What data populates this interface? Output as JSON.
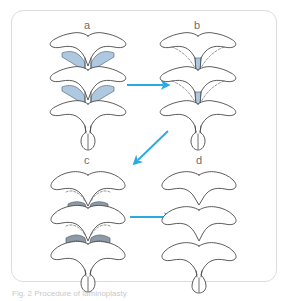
{
  "figure": {
    "background_color": "#ffffff",
    "frame_border_color": "#dcdcdc",
    "caption": "Fig. 2   Procedure of laminoplasty",
    "panels": [
      {
        "id": "a",
        "label": "a",
        "description": "Three stacked cervical vertebrae, posterior view, with bilateral laminae shaded light blue"
      },
      {
        "id": "b",
        "label": "b",
        "description": "Vertebrae after midline splitting, narrow central blue trough with dashed gutter lines"
      },
      {
        "id": "c",
        "label": "c",
        "description": "Vertebrae with darker gray-blue shaded lamina segments and dashed cut lines"
      },
      {
        "id": "d",
        "label": "d",
        "description": "Three separated vertebral arches, unshaded outlines only"
      }
    ],
    "arrows": [
      {
        "id": "arrow-a-to-b",
        "from": "a",
        "to": "b",
        "direction": "right"
      },
      {
        "id": "arrow-b-to-c",
        "from": "b",
        "to": "c",
        "direction": "down-left"
      },
      {
        "id": "arrow-c-to-d",
        "from": "c",
        "to": "d",
        "direction": "right"
      }
    ],
    "colors": {
      "arrow": "#29abe2",
      "outline": "#4a4a4a",
      "shade_light_blue": "#aec8e0",
      "shade_dark_blue_gray": "#8d9aa8",
      "dashed_line": "#6a6a6a",
      "label_text": "#6d6d6d",
      "caption_text": "#c9c9c9"
    }
  }
}
